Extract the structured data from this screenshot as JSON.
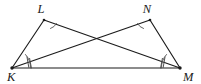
{
  "figure": {
    "background_color": "#ffffff",
    "line_color": "#1b1b1b",
    "mark_color": "#5a5a5a",
    "width": 201,
    "height": 84
  },
  "vertices": [
    {
      "name": "K",
      "label": "K",
      "x": 12,
      "y": 68,
      "label_x": 7,
      "label_y": 81
    },
    {
      "name": "L",
      "label": "L",
      "x": 44,
      "y": 20,
      "label_x": 41,
      "label_y": 13
    },
    {
      "name": "N",
      "label": "N",
      "x": 150,
      "y": 20,
      "label_x": 147,
      "label_y": 13
    },
    {
      "name": "M",
      "label": "M",
      "x": 180,
      "y": 68,
      "label_x": 183,
      "label_y": 81
    }
  ],
  "segments": [
    {
      "name": "segment-KL",
      "from": "K",
      "to": "L",
      "x1": 12,
      "y1": 68,
      "x2": 44,
      "y2": 20
    },
    {
      "name": "segment-LM",
      "from": "L",
      "to": "M",
      "x1": 44,
      "y1": 20,
      "x2": 180,
      "y2": 68
    },
    {
      "name": "segment-KN",
      "from": "K",
      "to": "N",
      "x1": 12,
      "y1": 68,
      "x2": 150,
      "y2": 20
    },
    {
      "name": "segment-NM",
      "from": "N",
      "to": "M",
      "x1": 150,
      "y1": 20,
      "x2": 180,
      "y2": 68
    },
    {
      "name": "segment-KM",
      "from": "K",
      "to": "M",
      "x1": 12,
      "y1": 68,
      "x2": 180,
      "y2": 68
    }
  ],
  "intersection": {
    "name": "crossing-point",
    "x": 97,
    "y": 40
  },
  "angle_marks": [
    {
      "name": "angle-arc-L",
      "vertex": "L",
      "ticks": 0,
      "arcs": 1,
      "path": "M 50.5 28.5 A 10.5 10.5 0 0 0 56.5 23.5"
    },
    {
      "name": "angle-arc-N",
      "vertex": "N",
      "ticks": 0,
      "arcs": 1,
      "path": "M 137.5 23.5 A 10.5 10.5 0 0 0 143.5 28.5"
    },
    {
      "name": "angle-arc-K",
      "vertex": "K",
      "ticks": 2,
      "arcs": 1,
      "path": "M 30.5 68 A 19 19 0 0 0 25.5 54.5"
    },
    {
      "name": "angle-arc-M",
      "vertex": "M",
      "ticks": 2,
      "arcs": 1,
      "path": "M 166.5 54.5 A 19 19 0 0 0 161.5 68"
    }
  ],
  "angle_ticks": [
    {
      "name": "tick-K-1",
      "x1": 27.0,
      "y1": 57.0,
      "x2": 28.8,
      "y2": 67.4
    },
    {
      "name": "tick-K-2",
      "x1": 29.6,
      "y1": 58.4,
      "x2": 31.4,
      "y2": 68.0
    },
    {
      "name": "tick-M-1",
      "x1": 165.0,
      "y1": 57.0,
      "x2": 163.2,
      "y2": 67.4
    },
    {
      "name": "tick-M-2",
      "x1": 162.4,
      "y1": 58.4,
      "x2": 160.6,
      "y2": 68.0
    }
  ],
  "labels": {
    "K": "K",
    "L": "L",
    "N": "N",
    "M": "M"
  }
}
